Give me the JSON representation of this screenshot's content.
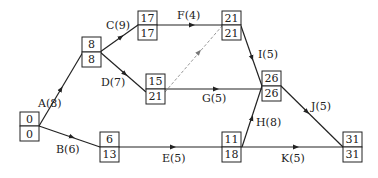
{
  "diagram": {
    "type": "activity-on-arrow network (critical path)",
    "colors": {
      "line": "#222222",
      "dummy": "#999999",
      "background": "#ffffff"
    },
    "nodes": [
      {
        "id": "n0",
        "top": "0",
        "bottom": "0",
        "x": 20,
        "y": 112
      },
      {
        "id": "n1",
        "top": "8",
        "bottom": "8",
        "x": 83,
        "y": 37
      },
      {
        "id": "n2",
        "top": "17",
        "bottom": "17",
        "x": 138,
        "y": 11
      },
      {
        "id": "n3",
        "top": "15",
        "bottom": "21",
        "x": 146,
        "y": 78
      },
      {
        "id": "n4",
        "top": "21",
        "bottom": "21",
        "x": 222,
        "y": 11
      },
      {
        "id": "n5",
        "top": "26",
        "bottom": "26",
        "x": 262,
        "y": 71
      },
      {
        "id": "n6",
        "top": "6",
        "bottom": "13",
        "x": 100,
        "y": 132
      },
      {
        "id": "n7",
        "top": "11",
        "bottom": "18",
        "x": 222,
        "y": 132
      },
      {
        "id": "n8",
        "top": "31",
        "bottom": "31",
        "x": 343,
        "y": 132
      }
    ],
    "edges": [
      {
        "label": "A(8)",
        "from": "n0",
        "to": "n1",
        "dashed": false
      },
      {
        "label": "B(6)",
        "from": "n0",
        "to": "n6",
        "dashed": false
      },
      {
        "label": "C(9)",
        "from": "n1",
        "to": "n2",
        "dashed": false
      },
      {
        "label": "D(7)",
        "from": "n1",
        "to": "n3",
        "dashed": false
      },
      {
        "label": "E(5)",
        "from": "n6",
        "to": "n7",
        "dashed": false
      },
      {
        "label": "F(4)",
        "from": "n2",
        "to": "n4",
        "dashed": false
      },
      {
        "label": "G(5)",
        "from": "n3",
        "to": "n5",
        "dashed": false
      },
      {
        "label": "H(8)",
        "from": "n7",
        "to": "n5",
        "dashed": false
      },
      {
        "label": "I(5)",
        "from": "n4",
        "to": "n5",
        "dashed": false
      },
      {
        "label": "J(5)",
        "from": "n5",
        "to": "n8",
        "dashed": false
      },
      {
        "label": "K(5)",
        "from": "n7",
        "to": "n8",
        "dashed": false
      },
      {
        "label": "",
        "from": "n3",
        "to": "n4",
        "dashed": true
      }
    ]
  }
}
